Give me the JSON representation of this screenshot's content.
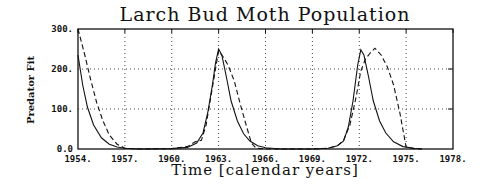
{
  "chart_data": {
    "type": "line",
    "title": "Larch Bud Moth Population",
    "xlabel": "Time [calendar years]",
    "ylabel": "Predator Fit",
    "xlim": [
      1954,
      1978
    ],
    "ylim": [
      0,
      300
    ],
    "grid": "dotted",
    "legend": null,
    "x_ticks": [
      "1954.",
      "1957.",
      "1960.",
      "1963.",
      "1966.",
      "1969.",
      "1972.",
      "1975.",
      "1978."
    ],
    "y_ticks": [
      "0.0",
      "100.",
      "200.",
      "300."
    ],
    "series": [
      {
        "name": "solid",
        "style": "solid",
        "x": [
          1954.0,
          1954.3,
          1954.6,
          1955.0,
          1955.5,
          1956.0,
          1956.5,
          1957.0,
          1958.0,
          1960.0,
          1961.0,
          1961.6,
          1962.0,
          1962.3,
          1962.6,
          1962.8,
          1963.0,
          1963.2,
          1963.5,
          1963.8,
          1964.2,
          1964.6,
          1965.0,
          1965.5,
          1966.0,
          1967.0,
          1969.0,
          1970.0,
          1970.6,
          1971.0,
          1971.3,
          1971.6,
          1971.9,
          1972.1,
          1972.3,
          1972.6,
          1972.9,
          1973.3,
          1973.7,
          1974.2,
          1974.8,
          1975.5,
          1976.0
        ],
        "values": [
          235,
          160,
          105,
          60,
          28,
          12,
          5,
          2,
          0,
          1,
          4,
          15,
          40,
          90,
          160,
          215,
          250,
          235,
          180,
          120,
          70,
          38,
          20,
          8,
          3,
          0,
          0,
          2,
          8,
          20,
          55,
          120,
          210,
          248,
          235,
          180,
          120,
          70,
          40,
          18,
          6,
          2,
          0
        ]
      },
      {
        "name": "dashed",
        "style": "dashed",
        "x": [
          1954.0,
          1954.4,
          1954.8,
          1955.2,
          1955.6,
          1956.0,
          1956.5,
          1957.0,
          1958.0,
          1960.0,
          1961.0,
          1961.5,
          1961.9,
          1962.2,
          1962.5,
          1962.8,
          1963.0,
          1963.3,
          1963.6,
          1964.0,
          1964.4,
          1964.8,
          1965.1,
          1965.4,
          1966.0,
          1967.0,
          1969.0,
          1970.0,
          1970.6,
          1971.0,
          1971.4,
          1971.8,
          1972.1,
          1972.4,
          1972.7,
          1973.0,
          1973.4,
          1973.8,
          1974.2,
          1974.6,
          1975.0,
          1975.5,
          1976.0
        ],
        "values": [
          300,
          240,
          175,
          115,
          70,
          35,
          12,
          2,
          0,
          1,
          6,
          18,
          22,
          60,
          130,
          200,
          245,
          230,
          210,
          170,
          110,
          55,
          15,
          2,
          0,
          0,
          0,
          2,
          8,
          22,
          60,
          130,
          195,
          225,
          240,
          252,
          235,
          205,
          160,
          90,
          5,
          1,
          0
        ]
      }
    ]
  }
}
